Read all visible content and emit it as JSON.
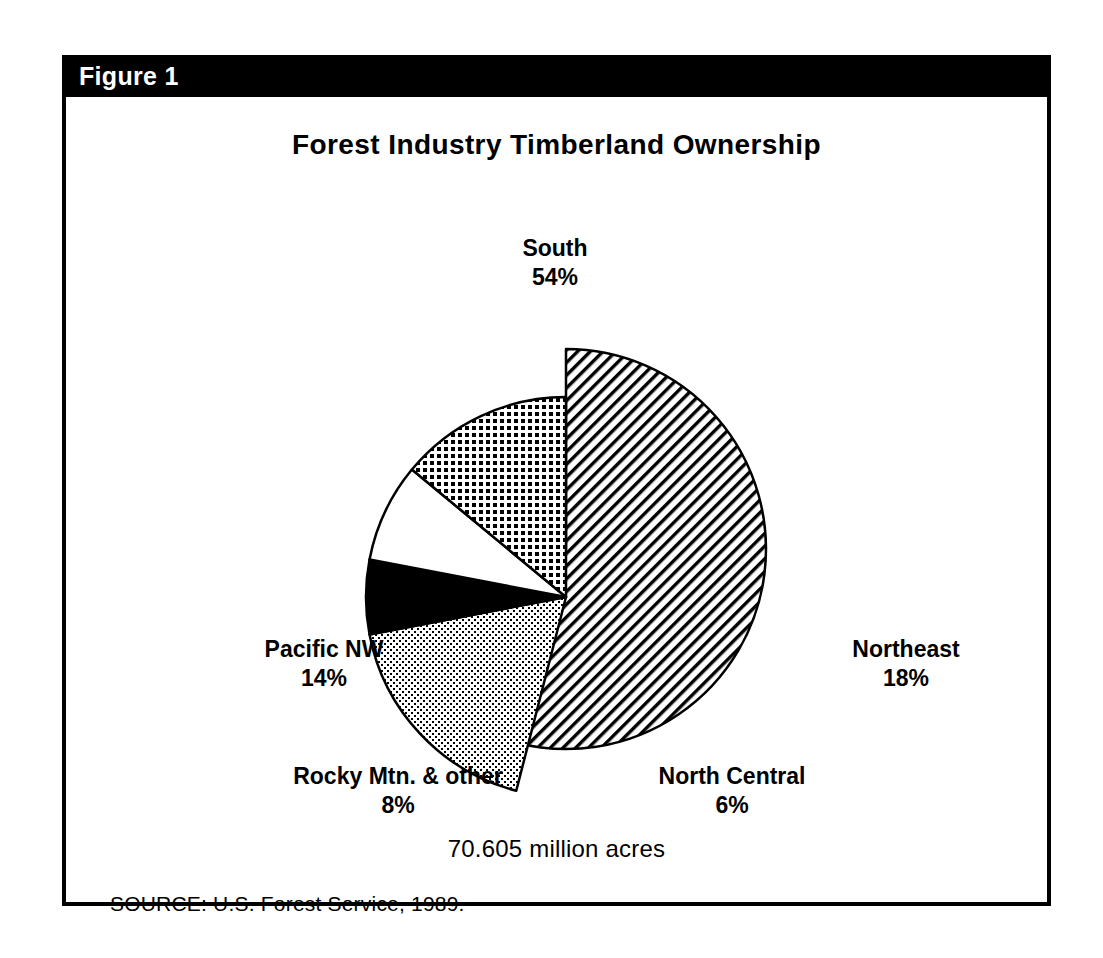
{
  "figure": {
    "header_label": "Figure 1",
    "title": "Forest Industry Timberland Ownership",
    "total_acres": "70.605 million acres",
    "source_note": "SOURCE:   U.S. Forest Service, 1989."
  },
  "labels": {
    "south": {
      "name": "South",
      "pct": "54%"
    },
    "northeast": {
      "name": "Northeast",
      "pct": "18%"
    },
    "pacific_nw": {
      "name": "Pacific NW",
      "pct": "14%"
    },
    "rocky": {
      "name": "Rocky Mtn. & other",
      "pct": "8%"
    },
    "north_central": {
      "name": "North Central",
      "pct": "6%"
    }
  },
  "colors": {
    "ink": "#000000",
    "paper": "#ffffff",
    "header_bar": "#000000",
    "header_text": "#ffffff"
  },
  "chart_data": {
    "type": "pie",
    "title": "Forest Industry Timberland Ownership",
    "subtitle": "70.605 million acres",
    "source": "SOURCE:   U.S. Forest Service, 1989.",
    "unit": "percent of total timberland acres",
    "total_label": "70.605 million acres",
    "total_value": 70.605,
    "total_unit": "million acres",
    "categories": [
      "South",
      "Northeast",
      "North Central",
      "Rocky Mtn. & other",
      "Pacific NW"
    ],
    "values": [
      54,
      18,
      6,
      8,
      14
    ],
    "slices": [
      {
        "label": "South",
        "value": 54,
        "fill": "diagonal-hatch",
        "exploded": true
      },
      {
        "label": "Northeast",
        "value": 18,
        "fill": "fine-stipple",
        "exploded": false
      },
      {
        "label": "North Central",
        "value": 6,
        "fill": "solid-black",
        "exploded": false
      },
      {
        "label": "Rocky Mtn. & other",
        "value": 8,
        "fill": "white",
        "exploded": false
      },
      {
        "label": "Pacific NW",
        "value": 14,
        "fill": "dense-grid",
        "exploded": false
      }
    ],
    "legend": "none (labels placed around pie)",
    "grid": false,
    "start_angle_deg": -90,
    "direction": "clockwise"
  }
}
